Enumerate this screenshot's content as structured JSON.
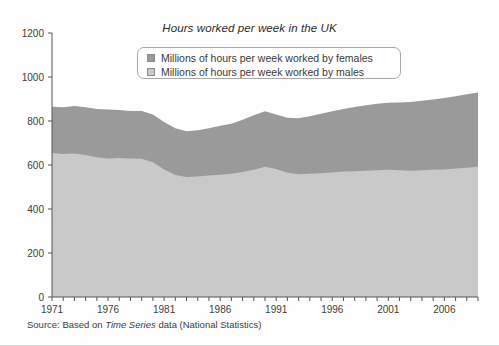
{
  "chart_data": {
    "type": "area",
    "stacked": true,
    "title": "Hours worked per week in the UK",
    "xlabel": "",
    "ylabel": "",
    "ylim": [
      0,
      1200
    ],
    "yticks": [
      0,
      200,
      400,
      600,
      800,
      1000,
      1200
    ],
    "xlim": [
      1971,
      2009
    ],
    "xticks_labeled": [
      1971,
      1976,
      1981,
      1986,
      1991,
      1996,
      2001,
      2006
    ],
    "xtick_step_minor": 1,
    "grid": false,
    "legend_position": "upper center",
    "units": "millions of hours per week",
    "x": [
      1971,
      1972,
      1973,
      1974,
      1975,
      1976,
      1977,
      1978,
      1979,
      1980,
      1981,
      1982,
      1983,
      1984,
      1985,
      1986,
      1987,
      1988,
      1989,
      1990,
      1991,
      1992,
      1993,
      1994,
      1995,
      1996,
      1997,
      1998,
      1999,
      2000,
      2001,
      2002,
      2003,
      2004,
      2005,
      2006,
      2007,
      2008,
      2009
    ],
    "series": [
      {
        "name": "Millions of hours per week worked by males",
        "color": "#c9c9c9",
        "values": [
          655,
          650,
          652,
          645,
          635,
          630,
          632,
          630,
          628,
          612,
          580,
          555,
          545,
          548,
          552,
          556,
          560,
          568,
          578,
          592,
          582,
          565,
          558,
          560,
          563,
          566,
          570,
          572,
          574,
          576,
          578,
          576,
          574,
          576,
          578,
          580,
          584,
          588,
          592
        ]
      },
      {
        "name": "Millions of hours per week worked by females",
        "color": "#9a9a9a",
        "values": [
          210,
          213,
          216,
          218,
          220,
          222,
          218,
          215,
          218,
          218,
          215,
          212,
          208,
          210,
          215,
          222,
          228,
          238,
          248,
          252,
          248,
          250,
          255,
          262,
          270,
          278,
          285,
          292,
          298,
          302,
          305,
          308,
          312,
          316,
          320,
          324,
          328,
          334,
          338
        ]
      }
    ],
    "totals": [
      865,
      863,
      868,
      863,
      855,
      852,
      850,
      845,
      846,
      830,
      795,
      767,
      753,
      758,
      767,
      778,
      788,
      806,
      826,
      844,
      830,
      815,
      813,
      822,
      833,
      844,
      855,
      864,
      872,
      878,
      883,
      884,
      886,
      892,
      898,
      904,
      912,
      922,
      930
    ]
  },
  "legend": {
    "items": [
      {
        "label": "Millions of hours per week worked by females",
        "swatch": "female-swatch"
      },
      {
        "label": "Millions of hours per week worked by males",
        "swatch": "male-swatch"
      }
    ]
  },
  "axes": {
    "y_labels": [
      "1200",
      "1000",
      "800",
      "600",
      "400",
      "200",
      "0"
    ],
    "x_labels": [
      "1971",
      "1976",
      "1981",
      "1986",
      "1991",
      "1996",
      "2001",
      "2006"
    ]
  },
  "source": {
    "prefix": "Source: Based on ",
    "italic": "Time Series",
    "suffix": " data (National Statistics)"
  },
  "colors": {
    "female_area": "#9a9a9a",
    "male_area": "#c9c9c9",
    "axis": "#555555",
    "text": "#3c3c3c"
  }
}
